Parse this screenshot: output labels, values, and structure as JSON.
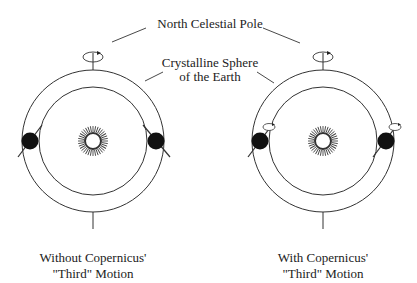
{
  "labels": {
    "pole": "North Celestial Pole",
    "sphere_line1": "Crystalline Sphere",
    "sphere_line2": "of the Earth"
  },
  "panels": [
    {
      "id": "without",
      "caption_line1": "Without Copernicus'",
      "caption_line2": "\"Third\" Motion",
      "center": [
        93,
        141
      ],
      "earth_spin_arrows": false
    },
    {
      "id": "with",
      "caption_line1": "With Copernicus'",
      "caption_line2": "\"Third\" Motion",
      "center": [
        323,
        141
      ],
      "earth_spin_arrows": true
    }
  ],
  "colors": {
    "ink": "#222222",
    "background": "#ffffff"
  }
}
